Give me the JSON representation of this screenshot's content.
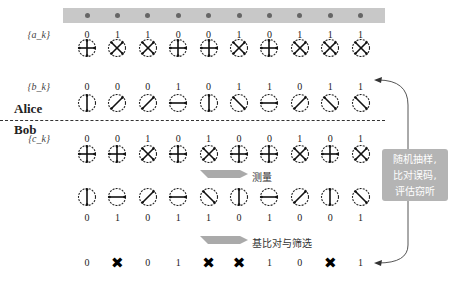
{
  "sequences": {
    "a": {
      "label": "{a_k}",
      "bits": [
        "0",
        "1",
        "1",
        "0",
        "0",
        "1",
        "0",
        "1",
        "1",
        "1"
      ],
      "bases": [
        "plus",
        "cross",
        "cross",
        "plus",
        "plus",
        "cross",
        "plus",
        "cross",
        "cross",
        "cross"
      ]
    },
    "b": {
      "label": "{b_k}",
      "bits": [
        "0",
        "0",
        "0",
        "1",
        "0",
        "1",
        "1",
        "0",
        "1",
        "1"
      ],
      "states": [
        "vertical",
        "diag",
        "diag",
        "horizontal",
        "vertical",
        "antidiag",
        "horizontal",
        "diag",
        "antidiag",
        "antidiag"
      ]
    },
    "c": {
      "label": "{c_k}",
      "bits": [
        "0",
        "0",
        "1",
        "0",
        "1",
        "0",
        "0",
        "1",
        "0",
        "1"
      ],
      "bases": [
        "plus",
        "plus",
        "cross",
        "plus",
        "cross",
        "plus",
        "plus",
        "cross",
        "plus",
        "cross"
      ]
    },
    "measured": {
      "states": [
        "vertical",
        "horizontal",
        "diag",
        "horizontal",
        "antidiag",
        "vertical",
        "horizontal",
        "diag",
        "vertical",
        "antidiag"
      ],
      "bits": [
        "0",
        "1",
        "0",
        "1",
        "1",
        "0",
        "1",
        "0",
        "0",
        "1"
      ]
    },
    "sifted": [
      "0",
      "✖",
      "0",
      "1",
      "✖",
      "✖",
      "1",
      "0",
      "✖",
      "1"
    ]
  },
  "parties": {
    "alice": "Alice",
    "bob": "Bob"
  },
  "steps": {
    "measure": "测量",
    "sift": "基比对与筛选"
  },
  "note": {
    "line1": "随机抽样,",
    "line2": "比对误码,",
    "line3": "评估窃听"
  },
  "colors": {
    "bar": "#c8c8c8",
    "note_bg": "#b4b4b4",
    "arrow": "#aaaaaa"
  }
}
